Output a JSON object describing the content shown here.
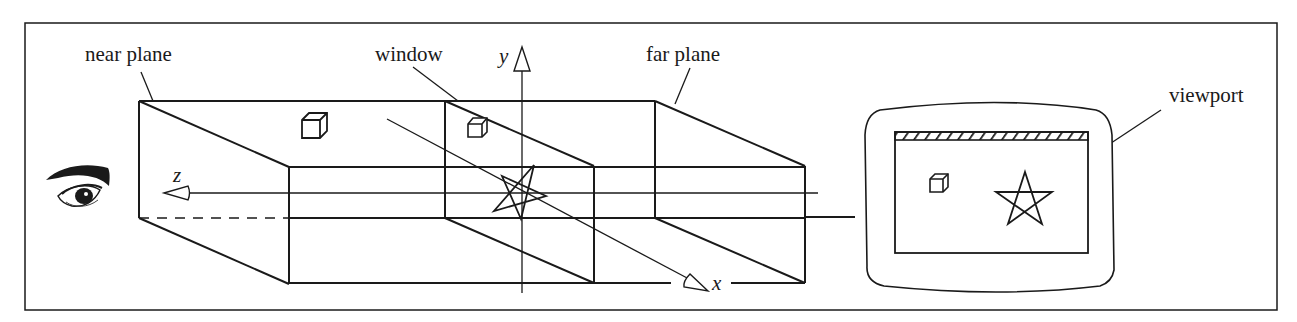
{
  "labels": {
    "near_plane": "near plane",
    "window": "window",
    "far_plane": "far plane",
    "viewport": "viewport"
  },
  "axes": {
    "x": "x",
    "y": "y",
    "z": "z"
  },
  "colors": {
    "ink": "#1a1a1a",
    "background": "#ffffff"
  }
}
